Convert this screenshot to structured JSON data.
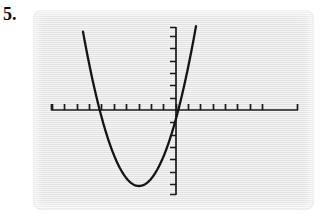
{
  "problem": {
    "number_label": "5."
  },
  "screen": {
    "name": "graphing-calculator-screen",
    "background_color": "#e9e9e9",
    "width": 279,
    "height": 198
  },
  "chart_data": {
    "type": "line",
    "title": "",
    "subtitle": "",
    "xlabel": "",
    "ylabel": "",
    "grid": false,
    "legend_position": "none",
    "axes": {
      "x_axis": {
        "visible": true,
        "color": "#1a1a1a",
        "pixel_y": 99,
        "pixel_x_start": 17,
        "pixel_x_end": 264,
        "tick_count": 21,
        "tick_spacing_px": 12.35,
        "tick_direction": "up",
        "tick_length_px": 6,
        "tick_labels": [],
        "origin_tick_index": 13,
        "xlim": [
          -10,
          10
        ]
      },
      "y_axis": {
        "visible": true,
        "color": "#1a1a1a",
        "pixel_x": 142,
        "pixel_y_start": 16,
        "pixel_y_end": 184,
        "tick_count": 14,
        "tick_spacing_px": 12.35,
        "tick_direction": "left",
        "tick_length_px": 6,
        "tick_labels": [],
        "ylim": [
          -7,
          7
        ]
      }
    },
    "series": [
      {
        "name": "parabola",
        "shape": "upward-opening parabola",
        "color": "#151515",
        "stroke_width_px": 2.3,
        "vertex": {
          "x": -0.3,
          "y": -7.0,
          "pixel_x": 105,
          "pixel_y": 175
        },
        "x_intercepts": [
          -3.2,
          2.8
        ],
        "x_intercept_pixels": [
          67,
          143
        ],
        "endpoints": [
          {
            "pixel_x": 49,
            "pixel_y": 19
          },
          {
            "pixel_x": 162,
            "pixel_y": 17
          }
        ],
        "path_points": [
          [
            49,
            19
          ],
          [
            55,
            47
          ],
          [
            61,
            72
          ],
          [
            67,
            95
          ],
          [
            73,
            116
          ],
          [
            79,
            134
          ],
          [
            85,
            150
          ],
          [
            91,
            162
          ],
          [
            97,
            170
          ],
          [
            103,
            175
          ],
          [
            109,
            175
          ],
          [
            115,
            171
          ],
          [
            121,
            163
          ],
          [
            127,
            151
          ],
          [
            133,
            135
          ],
          [
            139,
            116
          ],
          [
            145,
            94
          ],
          [
            151,
            69
          ],
          [
            157,
            42
          ],
          [
            162,
            17
          ]
        ]
      }
    ]
  }
}
